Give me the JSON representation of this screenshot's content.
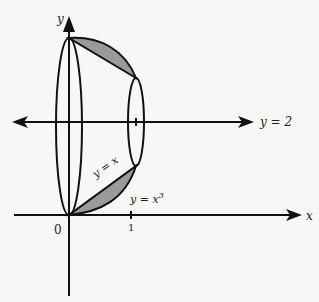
{
  "diagram": {
    "labels": {
      "y_axis": "y",
      "x_axis": "x",
      "origin": "0",
      "tick_one": "1",
      "line_y2": "y = 2",
      "curve_linear": "y = x",
      "curve_cubic_base": "y = x",
      "curve_cubic_exp": "3"
    },
    "colors": {
      "stroke": "#111111",
      "shade": "#9a9a9a",
      "background": "#f7f7f5"
    }
  }
}
